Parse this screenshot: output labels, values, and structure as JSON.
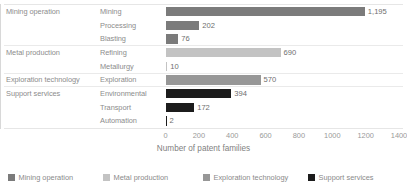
{
  "chart_data": {
    "type": "bar",
    "orientation": "horizontal",
    "title": "",
    "subtitle": "",
    "xlabel": "Number of patent families",
    "ylabel": "",
    "xlim": [
      0,
      1400
    ],
    "xticks": [
      0,
      200,
      400,
      600,
      800,
      1000,
      1200,
      1400
    ],
    "xtick_labels": [
      "0",
      "200",
      "400",
      "600",
      "800",
      "1000",
      "1200",
      "1400"
    ],
    "grid": false,
    "legend_position": "bottom",
    "categories": [
      "Mining",
      "Processing",
      "Blasting",
      "Refining",
      "Metallurgy",
      "Exploration",
      "Environmental",
      "Transport",
      "Automation"
    ],
    "values": [
      1195,
      202,
      76,
      690,
      10,
      570,
      394,
      172,
      2
    ],
    "value_labels": [
      "1,195",
      "202",
      "76",
      "690",
      "10",
      "570",
      "394",
      "172",
      "2"
    ],
    "groups": [
      {
        "name": "Mining operation",
        "color": "#7b7b7b",
        "items": [
          {
            "label": "Mining",
            "value": 1195,
            "value_label": "1,195"
          },
          {
            "label": "Processing",
            "value": 202,
            "value_label": "202"
          },
          {
            "label": "Blasting",
            "value": 76,
            "value_label": "76"
          }
        ]
      },
      {
        "name": "Metal production",
        "color": "#c3c3c3",
        "items": [
          {
            "label": "Refining",
            "value": 690,
            "value_label": "690"
          },
          {
            "label": "Metallurgy",
            "value": 10,
            "value_label": "10"
          }
        ]
      },
      {
        "name": "Exploration technology",
        "color": "#979797",
        "items": [
          {
            "label": "Exploration",
            "value": 570,
            "value_label": "570"
          }
        ]
      },
      {
        "name": "Support services",
        "color": "#1c1c1c",
        "items": [
          {
            "label": "Environmental",
            "value": 394,
            "value_label": "394"
          },
          {
            "label": "Transport",
            "value": 172,
            "value_label": "172"
          },
          {
            "label": "Automation",
            "value": 2,
            "value_label": "2"
          }
        ]
      }
    ],
    "legend": [
      {
        "label": "Mining operation",
        "color": "#7b7b7b"
      },
      {
        "label": "Metal production",
        "color": "#c3c3c3"
      },
      {
        "label": "Exploration technology",
        "color": "#979797"
      },
      {
        "label": "Support services",
        "color": "#1c1c1c"
      }
    ]
  }
}
